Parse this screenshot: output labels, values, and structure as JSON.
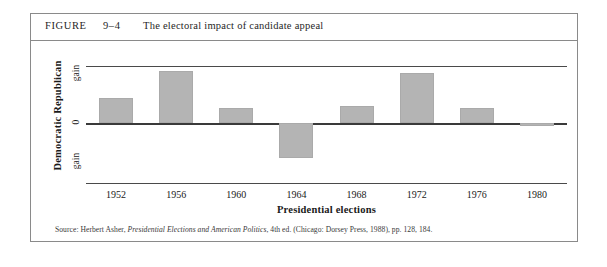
{
  "figure": {
    "label": "FIGURE",
    "number": "9–4",
    "title": "The electoral impact of candidate appeal"
  },
  "axes": {
    "y_title": "Democratic  Republican",
    "y_sub_top": "gain",
    "y_sub_zero": "0",
    "y_sub_bottom": "gain",
    "x_title": "Presidential elections"
  },
  "source": {
    "prefix": "Source: Herbert Asher, ",
    "italic_title": "Presidential Elections and American Politics",
    "suffix": ", 4th ed. (Chicago: Dorsey Press, 1988), pp. 128, 184."
  },
  "colors": {
    "bar_fill": "#b4b4b4",
    "rule": "#4a4a4a",
    "border": "#8a8a8a"
  },
  "chart_data": {
    "type": "bar",
    "title": "The electoral impact of candidate appeal",
    "xlabel": "Presidential elections",
    "ylabel": "Democratic gain / Republican gain",
    "categories": [
      "1952",
      "1956",
      "1960",
      "1964",
      "1968",
      "1972",
      "1976",
      "1980"
    ],
    "values": [
      25,
      52,
      15,
      -35,
      17,
      50,
      15,
      -3
    ],
    "value_units": "pixels above/below zero line (relative candidate-appeal advantage)",
    "ylim": [
      -60,
      57
    ],
    "zero_line": 0,
    "grid": false,
    "legend": null
  }
}
